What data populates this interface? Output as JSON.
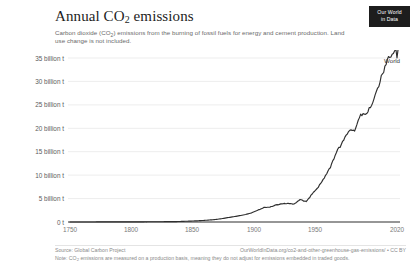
{
  "header": {
    "title_prefix": "Annual CO",
    "title_sub": "2",
    "title_suffix": " emissions",
    "subtitle_part1": "Carbon dioxide (CO",
    "subtitle_sub": "2",
    "subtitle_part2": ") emissions from the burning of fossil fuels for energy and cement production. Land use change is not included.",
    "logo_line1": "Our World",
    "logo_line2": "in Data"
  },
  "footer": {
    "source": "Source: Global Carbon Project",
    "link": "OurWorldInData.org/co2-and-other-greenhouse-gas-emissions/ • CC BY",
    "note_part1": "Note: CO",
    "note_sub": "2",
    "note_part2": " emissions are measured on a production basis, meaning they do not adjust for emissions embedded in traded goods."
  },
  "colors": {
    "line": "#2f2f2f",
    "grid": "#ededed",
    "axis": "#2f2f2f",
    "text": "#5b5b5b",
    "logo_bg": "#1d1d1d"
  },
  "chart_data": {
    "type": "line",
    "title": "Annual CO2 emissions",
    "subtitle": "Carbon dioxide (CO2) emissions from the burning of fossil fuels for energy and cement production. Land use change is not included.",
    "xlabel": "",
    "ylabel": "",
    "xlim": [
      1750,
      2021
    ],
    "ylim": [
      0,
      37000000000
    ],
    "grid": true,
    "legend_position": "end-of-line",
    "ytick_labels": [
      "0 t",
      "5 billion t",
      "10 billion t",
      "15 billion t",
      "20 billion t",
      "25 billion t",
      "30 billion t",
      "35 billion t"
    ],
    "ytick_values": [
      0,
      5,
      10,
      15,
      20,
      25,
      30,
      35
    ],
    "ytick_unit": "billion tonnes",
    "xtick_labels": [
      "1750",
      "1800",
      "1850",
      "1900",
      "1950",
      "2020"
    ],
    "xtick_values": [
      1750,
      1800,
      1850,
      1900,
      1950,
      2020
    ],
    "series": [
      {
        "name": "World",
        "label": "World",
        "color": "#2f2f2f",
        "x": [
          1750,
          1760,
          1770,
          1780,
          1790,
          1800,
          1810,
          1820,
          1830,
          1840,
          1850,
          1855,
          1860,
          1865,
          1870,
          1875,
          1880,
          1885,
          1890,
          1895,
          1900,
          1905,
          1910,
          1915,
          1920,
          1925,
          1930,
          1935,
          1940,
          1945,
          1950,
          1955,
          1960,
          1965,
          1970,
          1975,
          1980,
          1985,
          1990,
          1995,
          2000,
          2005,
          2010,
          2012,
          2014,
          2016,
          2018,
          2019,
          2020,
          2021
        ],
        "values": [
          0.01,
          0.01,
          0.01,
          0.02,
          0.02,
          0.03,
          0.04,
          0.05,
          0.07,
          0.1,
          0.2,
          0.25,
          0.33,
          0.42,
          0.53,
          0.7,
          0.92,
          1.12,
          1.35,
          1.6,
          1.95,
          2.5,
          3.1,
          3.2,
          3.6,
          3.9,
          4.0,
          3.8,
          4.8,
          4.3,
          6.0,
          7.5,
          9.4,
          11.7,
          14.9,
          16.9,
          19.5,
          19.7,
          22.7,
          23.5,
          25.2,
          29.3,
          33.1,
          34.6,
          35.3,
          35.5,
          36.7,
          37.1,
          35.0,
          37.1
        ],
        "value_unit": "billion tonnes CO2"
      }
    ]
  }
}
